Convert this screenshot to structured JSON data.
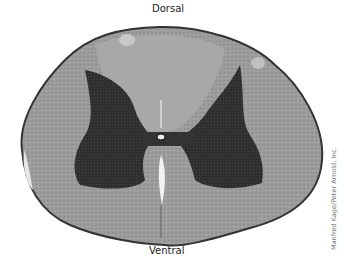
{
  "figure": {
    "labels": {
      "top": "Dorsal",
      "bottom": "Ventral"
    },
    "credit": "Manfred Kage/Peter Arnold, Inc.",
    "colors": {
      "white_matter": "#9a9a9a",
      "gray_matter": "#2e2e2e",
      "outline": "#3a3a3a",
      "background": "#ffffff"
    }
  }
}
